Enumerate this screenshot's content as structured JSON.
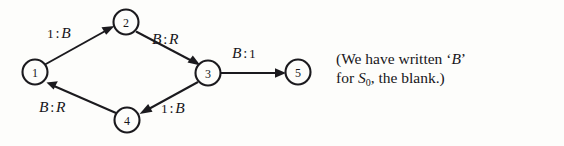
{
  "figure": {
    "type": "state-transition-diagram",
    "background_color": "#fdfdfb",
    "ink_color": "#17161a"
  },
  "nodes": [
    {
      "id": "1",
      "label": "1",
      "cx": 35,
      "cy": 72,
      "r": 12.5
    },
    {
      "id": "2",
      "label": "2",
      "cx": 126,
      "cy": 22,
      "r": 12.5
    },
    {
      "id": "3",
      "label": "3",
      "cx": 208,
      "cy": 73,
      "r": 12.5
    },
    {
      "id": "4",
      "label": "4",
      "cx": 127,
      "cy": 120,
      "r": 12.5
    },
    {
      "id": "5",
      "label": "5",
      "cx": 298,
      "cy": 72,
      "r": 12.5
    }
  ],
  "edges": [
    {
      "id": "e1",
      "from": "1",
      "to": "2",
      "read": "1",
      "write": "B",
      "label": "1 : B",
      "read_style": "smallcaps",
      "write_style": "italic"
    },
    {
      "id": "e2",
      "from": "2",
      "to": "3",
      "read": "B",
      "write": "R",
      "label": "B : R",
      "read_style": "italic",
      "write_style": "italic"
    },
    {
      "id": "e3",
      "from": "3",
      "to": "5",
      "read": "B",
      "write": "1",
      "label": "B : 1",
      "read_style": "italic",
      "write_style": "smallcaps"
    },
    {
      "id": "e4",
      "from": "3",
      "to": "4",
      "read": "1",
      "write": "B",
      "label": "1 : B",
      "read_style": "smallcaps",
      "write_style": "italic"
    },
    {
      "id": "e5",
      "from": "4",
      "to": "1",
      "read": "B",
      "write": "R",
      "label": "B : R",
      "read_style": "italic",
      "write_style": "italic"
    }
  ],
  "caption": {
    "line1_before": "(We have written ‘",
    "line1_symbol": "B",
    "line1_after": "’",
    "line2_before": "for ",
    "line2_symbol": "S",
    "line2_subscript": "0",
    "line2_after": ", the blank.)",
    "full_text": "(We have written ‘B’ for S0, the blank.)"
  }
}
